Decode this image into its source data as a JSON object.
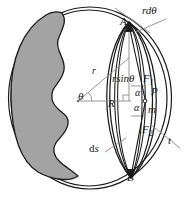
{
  "figure": {
    "colors": {
      "stroke": "#1a1a1a",
      "fill_shaded": "#a3a3a3",
      "thin_stroke": "#7d7d7d",
      "background": "#ffffff"
    },
    "labels": {
      "point_a": "A",
      "point_b": "B",
      "arc_length_top": "rdθ",
      "angle_theta": "θ",
      "radius_r": "r",
      "radius_R": "R",
      "chord_height": "rsinθ",
      "force_1": "F",
      "force_1_sub": "1",
      "force_2": "F",
      "force_2_sub": "2",
      "point_p": "P",
      "angle_alpha_upper": "α",
      "angle_alpha_lower": "α",
      "mass_m": "m",
      "thickness_t": "t",
      "arc_element_ds": "ds",
      "arc_element_ds_d": "d",
      "arc_element_ds_s": "s"
    }
  }
}
